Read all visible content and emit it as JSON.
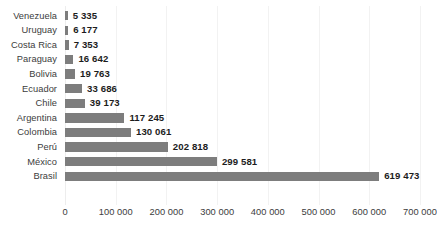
{
  "chart_data": {
    "type": "bar",
    "orientation": "horizontal",
    "title": "",
    "subtitle": "",
    "xlabel": "",
    "ylabel": "",
    "xlim": [
      0,
      700000
    ],
    "grid": true,
    "legend": null,
    "bar_color": "#7d7d7d",
    "label_color": "#3c3c3c",
    "value_color": "#1c1c1c",
    "background": "#ffffff",
    "categories": [
      "Venezuela",
      "Uruguay",
      "Costa Rica",
      "Paraguay",
      "Bolivia",
      "Ecuador",
      "Chile",
      "Argentina",
      "Colombia",
      "Perú",
      "México",
      "Brasil"
    ],
    "values": [
      5335,
      6177,
      7353,
      16642,
      19763,
      33686,
      39173,
      117245,
      130061,
      202818,
      299581,
      619473
    ],
    "value_labels": [
      "5 335",
      "6 177",
      "7 353",
      "16 642",
      "19 763",
      "33 686",
      "39 173",
      "117 245",
      "130 061",
      "202 818",
      "299 581",
      "619 473"
    ],
    "xticks": [
      0,
      100000,
      200000,
      300000,
      400000,
      500000,
      600000,
      700000
    ],
    "xtick_labels": [
      "0",
      "100 000",
      "200 000",
      "300 000",
      "400 000",
      "500 000",
      "600 000",
      "700 000"
    ]
  }
}
